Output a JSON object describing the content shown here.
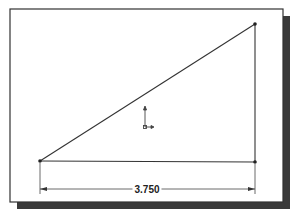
{
  "frame": {
    "x": 10,
    "y": 9,
    "width": 273,
    "height": 193,
    "border_color": "#333333",
    "shadow_color": "#3a3a3a",
    "shadow_offset": 7
  },
  "sketch": {
    "line_color": "#333333",
    "vertices": {
      "bottom_left": [
        40,
        161
      ],
      "bottom_right": [
        255,
        162
      ],
      "top": [
        255,
        24
      ]
    },
    "origin": [
      145,
      127
    ]
  },
  "dimension": {
    "value": "3.750",
    "y": 189,
    "x1": 40,
    "x2": 255,
    "label_x": 147
  }
}
